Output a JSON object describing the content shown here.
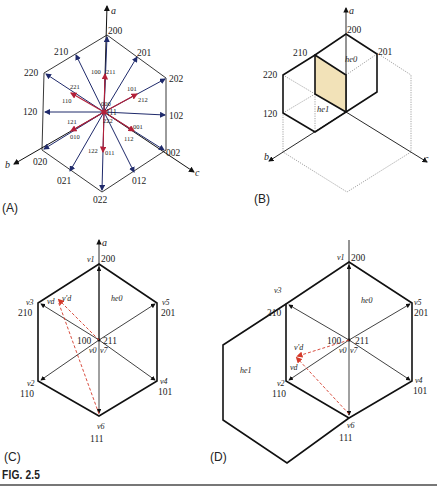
{
  "figure": {
    "caption": "FIG. 2.5",
    "panels": {
      "A": {
        "label": "(A)",
        "axes": {
          "a": "a",
          "b": "b",
          "c": "c"
        },
        "outer_vertices": [
          "200",
          "201",
          "202",
          "102",
          "002",
          "012",
          "022",
          "021",
          "020",
          "120",
          "220",
          "210"
        ],
        "inner_labels": [
          "100",
          "211",
          "101",
          "212",
          "001",
          "112",
          "122",
          "011",
          "121",
          "010",
          "221",
          "110",
          "000",
          "111",
          "222"
        ],
        "colors": {
          "outer_vectors": "#1f2a6b",
          "inner_vectors": "#b3203a",
          "hex": "#222222"
        }
      },
      "B": {
        "label": "(B)",
        "axes": {
          "a": "a",
          "b": "b",
          "c": "c"
        },
        "vertices": [
          "200",
          "201",
          "210",
          "220",
          "120"
        ],
        "regions": [
          "he0",
          "he1"
        ],
        "highlight_color": "#f2e2b8"
      },
      "C": {
        "label": "(C)",
        "axis": "a",
        "vectors": [
          {
            "name": "v1",
            "state": "200"
          },
          {
            "name": "v3",
            "state": "210"
          },
          {
            "name": "v5",
            "state": "201"
          },
          {
            "name": "v2",
            "state": "110"
          },
          {
            "name": "v4",
            "state": "101"
          },
          {
            "name": "v6",
            "state": "111"
          }
        ],
        "center": {
          "left": "100",
          "right": "211",
          "zero_left": "v0",
          "zero_right": "v7"
        },
        "region": "he0",
        "reference": {
          "vd": "vd",
          "vd_prime": "v'd"
        },
        "ref_color": "#d43a2a"
      },
      "D": {
        "label": "(D)",
        "vectors": [
          {
            "name": "v1",
            "state": "200"
          },
          {
            "name": "v3",
            "state": "210"
          },
          {
            "name": "v5",
            "state": "201"
          },
          {
            "name": "v2",
            "state": "110"
          },
          {
            "name": "v4",
            "state": "101"
          },
          {
            "name": "v6",
            "state": "111"
          }
        ],
        "center": {
          "left": "100",
          "right": "211",
          "zero_left": "v0",
          "zero_right": "v7"
        },
        "regions": [
          "he0",
          "he1"
        ],
        "reference": {
          "vd": "vd",
          "vd_prime": "v'd"
        },
        "ref_color": "#d43a2a"
      }
    }
  }
}
